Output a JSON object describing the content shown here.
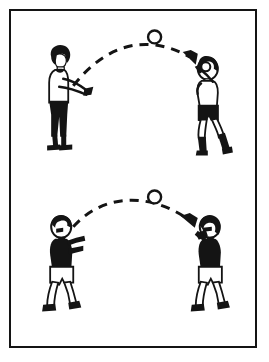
{
  "illustration": {
    "title": "Two-panel drill illustration: ball tossed in an arc between partners",
    "style": "black-and-white line art",
    "frame": {
      "border_color": "#141414",
      "background_color": "#ffffff",
      "border_width_px": 2.5
    },
    "panels": [
      {
        "id": "panel-top",
        "name": "upper-drill-panel",
        "description": "Standing partner tosses ball underhand in a high arc to a receiving partner",
        "trajectory": {
          "name": "ball-path-arc-top",
          "style": "dashed",
          "direction": "left-to-right",
          "has_arrowhead": true,
          "arrow_points_to": "receiver",
          "color": "#141414"
        },
        "ball": {
          "name": "ball-top",
          "shape": "circle",
          "fill": "#ffffff",
          "stroke": "#141414",
          "position_on_arc": "apex"
        },
        "figures": [
          {
            "role": "thrower",
            "name": "figure-thrower-top",
            "side": "left",
            "hair": "#141414",
            "shirt": "#ffffff",
            "shorts": "#141414",
            "legs": "#141414",
            "shoes": "#141414",
            "pose": "arms extended forward at waist, releasing ball"
          },
          {
            "role": "receiver",
            "name": "figure-receiver-top",
            "side": "right",
            "hair": "#141414",
            "shirt": "#ffffff",
            "shorts": "#141414",
            "legs": "#141414",
            "shoes": "#141414",
            "pose": "hands raised to face, preparing to catch"
          }
        ]
      },
      {
        "id": "panel-bottom",
        "name": "lower-drill-panel",
        "description": "Both partners in dark jerseys, ball travelling in a flatter arc left to right",
        "trajectory": {
          "name": "ball-path-arc-bottom",
          "style": "dashed",
          "direction": "left-to-right",
          "has_arrowhead": true,
          "arrow_points_to": "receiver",
          "color": "#141414"
        },
        "ball": {
          "name": "ball-bottom",
          "shape": "circle",
          "fill": "#ffffff",
          "stroke": "#141414",
          "position_on_arc": "apex"
        },
        "figures": [
          {
            "role": "thrower",
            "name": "figure-thrower-bottom",
            "side": "left",
            "hair": "#141414",
            "shirt": "#141414",
            "shorts": "#ffffff",
            "legs": "#ffffff",
            "shoes": "#141414",
            "pose": "arms up in front of chest, just released ball"
          },
          {
            "role": "receiver",
            "name": "figure-receiver-bottom",
            "side": "right",
            "hair": "#141414",
            "shirt": "#141414",
            "shorts": "#ffffff",
            "legs": "#ffffff",
            "shoes": "#141414",
            "pose": "hands raised, tracking incoming ball"
          }
        ]
      }
    ],
    "colors": {
      "ink": "#141414",
      "paper": "#ffffff"
    }
  }
}
